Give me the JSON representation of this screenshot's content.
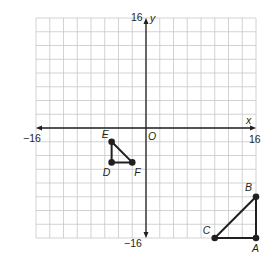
{
  "diagram": {
    "type": "coordinate-plane",
    "x_axis": {
      "label": "x",
      "min": -16,
      "max": 16,
      "min_label": "−16",
      "max_label": "16"
    },
    "y_axis": {
      "label": "y",
      "min": -16,
      "max": 16,
      "min_label": "−16",
      "max_label": "16"
    },
    "origin_label": "O",
    "grid": {
      "cells": 16,
      "units_per_cell": 2
    },
    "colors": {
      "grid": "#c8c8c8",
      "axis": "#231f20",
      "shape": "#231f20",
      "background": "#ffffff"
    },
    "triangles": [
      {
        "name": "ABC",
        "points": [
          {
            "label": "A",
            "x": 16,
            "y": -16
          },
          {
            "label": "B",
            "x": 16,
            "y": -10
          },
          {
            "label": "C",
            "x": 10,
            "y": -16
          }
        ]
      },
      {
        "name": "DEF",
        "points": [
          {
            "label": "D",
            "x": -5,
            "y": -5
          },
          {
            "label": "E",
            "x": -5,
            "y": -2
          },
          {
            "label": "F",
            "x": -2,
            "y": -5
          }
        ]
      }
    ]
  }
}
